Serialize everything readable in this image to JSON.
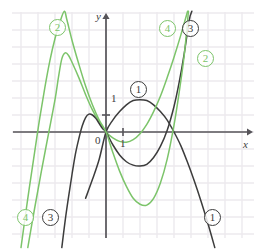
{
  "figure": {
    "width": 266,
    "height": 249,
    "background": "#ffffff",
    "grid_color": "#eceaee",
    "axis_color": "#565459",
    "dark_curve_color": "#3c3c3c",
    "green_curve_color": "#7cc46a"
  },
  "axes": {
    "x_label": "x",
    "y_label": "y",
    "origin_label": "0",
    "y_tick_label": "1",
    "x_tick_label": "1",
    "origin_px": {
      "x": 106,
      "y": 132
    },
    "unit_px": 17,
    "x_range": [
      -5.5,
      8.4
    ],
    "y_range": [
      -6.9,
      7.1
    ],
    "grid": true,
    "x_axis_arrow": true,
    "y_axis_arrow": true
  },
  "labels": [
    {
      "id": "tag-2-upper-left",
      "text": "2",
      "color": "green",
      "x": 49,
      "y": 19
    },
    {
      "id": "tag-4-upper-right",
      "text": "4",
      "color": "green",
      "x": 159,
      "y": 20
    },
    {
      "id": "tag-3-upper-right",
      "text": "3",
      "color": "dark",
      "x": 182,
      "y": 20
    },
    {
      "id": "tag-2-right",
      "text": "2",
      "color": "green",
      "x": 197,
      "y": 50
    },
    {
      "id": "tag-1-center",
      "text": "1",
      "color": "dark",
      "x": 130,
      "y": 81
    },
    {
      "id": "tag-4-lower-left",
      "text": "4",
      "color": "green",
      "x": 17,
      "y": 209
    },
    {
      "id": "tag-3-lower-left",
      "text": "3",
      "color": "dark",
      "x": 42,
      "y": 209
    },
    {
      "id": "tag-1-lower-right",
      "text": "1",
      "color": "dark",
      "x": 204,
      "y": 209
    }
  ],
  "chart_data": {
    "type": "line",
    "title": "",
    "xlabel": "x",
    "ylabel": "y",
    "xlim": [
      -5.5,
      8.4
    ],
    "ylim": [
      -6.9,
      7.1
    ],
    "grid": true,
    "legend": "inline-circled-numbers",
    "roots_shared": [
      0,
      4
    ],
    "series": [
      {
        "name": "1",
        "color": "#3c3c3c",
        "style": "solid",
        "description": "downward parabola through (0,0) and (4,0), vertex near (2,1.9)",
        "points": [
          [
            -1.2,
            -3.9
          ],
          [
            -0.8,
            -2.8
          ],
          [
            -0.4,
            -1.6
          ],
          [
            0.0,
            0.0
          ],
          [
            0.4,
            0.7
          ],
          [
            0.8,
            1.2
          ],
          [
            1.2,
            1.6
          ],
          [
            1.6,
            1.85
          ],
          [
            2.0,
            1.9
          ],
          [
            2.4,
            1.85
          ],
          [
            2.8,
            1.6
          ],
          [
            3.2,
            1.2
          ],
          [
            3.6,
            0.7
          ],
          [
            4.0,
            0.0
          ],
          [
            4.4,
            -0.8
          ],
          [
            4.8,
            -1.8
          ],
          [
            5.2,
            -2.9
          ],
          [
            5.6,
            -4.1
          ],
          [
            6.0,
            -5.4
          ],
          [
            6.4,
            -6.8
          ]
        ]
      },
      {
        "name": "2",
        "color": "#7cc46a",
        "style": "solid",
        "description": "cubic-like green curve with local max near (-2.5,4.6), rising steeply on the right",
        "points": [
          [
            -4.6,
            -6.8
          ],
          [
            -4.2,
            -4.5
          ],
          [
            -3.8,
            -2.3
          ],
          [
            -3.4,
            -0.2
          ],
          [
            -3.0,
            1.9
          ],
          [
            -2.8,
            3.2
          ],
          [
            -2.6,
            4.3
          ],
          [
            -2.4,
            4.65
          ],
          [
            -2.2,
            4.5
          ],
          [
            -2.0,
            4.1
          ],
          [
            -1.6,
            3.2
          ],
          [
            -1.2,
            2.2
          ],
          [
            -0.8,
            1.3
          ],
          [
            -0.4,
            0.6
          ],
          [
            0.0,
            0.0
          ],
          [
            0.4,
            -0.35
          ],
          [
            0.8,
            -0.55
          ],
          [
            1.2,
            -0.6
          ],
          [
            1.6,
            -0.45
          ],
          [
            2.0,
            -0.1
          ],
          [
            2.4,
            0.45
          ],
          [
            2.8,
            1.2
          ],
          [
            3.2,
            2.1
          ],
          [
            3.6,
            3.2
          ],
          [
            4.0,
            4.4
          ],
          [
            4.4,
            5.7
          ],
          [
            4.8,
            7.1
          ]
        ]
      },
      {
        "name": "3",
        "color": "#3c3c3c",
        "style": "solid",
        "description": "dark curve with local max near (-1,1.0), dipping to a minimum near (2.2,-2.0), rising steeply right of x=3.7",
        "points": [
          [
            -2.6,
            -6.8
          ],
          [
            -2.4,
            -5.2
          ],
          [
            -2.2,
            -3.8
          ],
          [
            -2.0,
            -2.5
          ],
          [
            -1.8,
            -1.3
          ],
          [
            -1.6,
            -0.4
          ],
          [
            -1.4,
            0.35
          ],
          [
            -1.2,
            0.85
          ],
          [
            -1.0,
            1.05
          ],
          [
            -0.8,
            1.0
          ],
          [
            -0.6,
            0.8
          ],
          [
            -0.4,
            0.5
          ],
          [
            -0.2,
            0.2
          ],
          [
            0.0,
            0.0
          ],
          [
            0.4,
            -0.75
          ],
          [
            0.8,
            -1.35
          ],
          [
            1.2,
            -1.75
          ],
          [
            1.6,
            -1.95
          ],
          [
            2.0,
            -2.0
          ],
          [
            2.4,
            -1.9
          ],
          [
            2.8,
            -1.5
          ],
          [
            3.2,
            -0.85
          ],
          [
            3.6,
            0.1
          ],
          [
            4.0,
            1.5
          ],
          [
            4.3,
            2.9
          ],
          [
            4.6,
            4.6
          ],
          [
            4.9,
            6.6
          ],
          [
            5.05,
            7.1
          ]
        ]
      },
      {
        "name": "4",
        "color": "#7cc46a",
        "style": "solid",
        "description": "steep green curve rising from lower left through origin region, minimum near (2.3,-4.3), steeply up past x=4",
        "points": [
          [
            -5.0,
            -6.8
          ],
          [
            -4.6,
            -3.9
          ],
          [
            -4.2,
            -1.2
          ],
          [
            -3.9,
            0.8
          ],
          [
            -3.6,
            2.6
          ],
          [
            -3.3,
            4.2
          ],
          [
            -3.0,
            5.5
          ],
          [
            -2.7,
            6.5
          ],
          [
            -2.45,
            7.1
          ],
          [
            -2.3,
            6.6
          ],
          [
            -2.0,
            5.4
          ],
          [
            -1.6,
            4.0
          ],
          [
            -1.2,
            2.7
          ],
          [
            -0.8,
            1.6
          ],
          [
            -0.4,
            0.7
          ],
          [
            0.0,
            0.0
          ],
          [
            0.4,
            -1.2
          ],
          [
            0.8,
            -2.3
          ],
          [
            1.2,
            -3.2
          ],
          [
            1.6,
            -3.9
          ],
          [
            2.0,
            -4.25
          ],
          [
            2.4,
            -4.3
          ],
          [
            2.8,
            -3.9
          ],
          [
            3.2,
            -3.0
          ],
          [
            3.6,
            -1.6
          ],
          [
            4.0,
            0.4
          ],
          [
            4.3,
            2.3
          ],
          [
            4.6,
            4.5
          ],
          [
            4.85,
            7.1
          ]
        ]
      }
    ]
  }
}
